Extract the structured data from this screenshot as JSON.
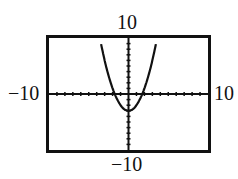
{
  "chart_data": {
    "type": "line",
    "title": "",
    "function": "y = x^2 - 3",
    "xlim": [
      -10,
      10
    ],
    "ylim": [
      -10,
      10
    ],
    "xscale": 1,
    "yscale": 1,
    "grid": false,
    "window_labels": {
      "xmin": "−10",
      "xmax": "10",
      "ymin": "−10",
      "ymax": "10"
    },
    "series": [
      {
        "name": "parabola",
        "x": [
          -3.4,
          -3,
          -2,
          -1.73,
          -1,
          0,
          1,
          1.73,
          2,
          3,
          3.4
        ],
        "y": [
          8.56,
          6,
          1,
          0,
          -2,
          -3,
          -2,
          0,
          1,
          6,
          8.56
        ]
      }
    ]
  }
}
